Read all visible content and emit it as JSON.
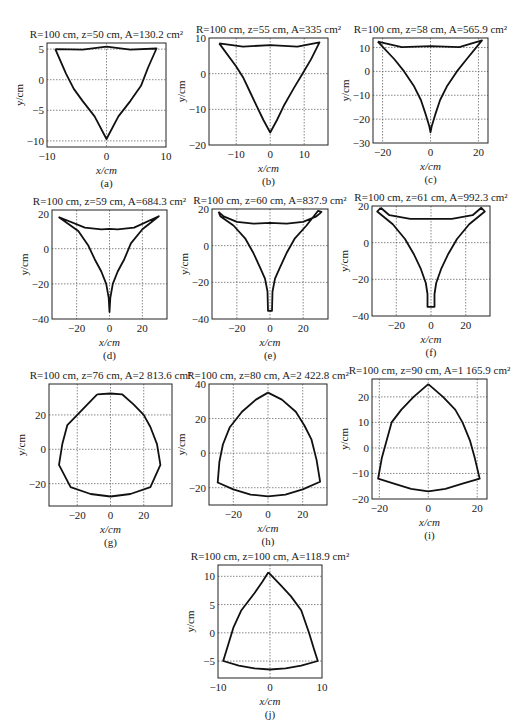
{
  "figure": {
    "caption_fragment": ""
  },
  "chart_data": [
    {
      "id": "a",
      "type": "line",
      "title": "R=100 cm, z=50 cm, A=130.2 cm²",
      "title_parts": {
        "R": "100 cm",
        "z": "50 cm",
        "A": "130.2 cm²"
      },
      "sublabel": "(a)",
      "xlabel": "x/cm",
      "ylabel": "y/cm",
      "xlim": [
        -10,
        10
      ],
      "ylim": [
        -11,
        6
      ],
      "xticks": [
        -10,
        0,
        10
      ],
      "yticks": [
        -10,
        -5,
        0,
        5
      ],
      "xgrid": [
        0
      ],
      "ygrid": [
        -10,
        -5,
        0,
        5
      ],
      "grid": true,
      "box": {
        "x": 47,
        "y": 43,
        "w": 119,
        "h": 104
      },
      "curves": [
        [
          [
            -8.6,
            5.0
          ],
          [
            -4,
            4.9
          ],
          [
            0,
            5.4
          ],
          [
            4,
            4.9
          ],
          [
            8.4,
            5.1
          ],
          [
            7,
            2
          ],
          [
            5.8,
            -1
          ],
          [
            4,
            -3.5
          ],
          [
            2,
            -6
          ],
          [
            0,
            -9.7
          ],
          [
            -2,
            -6
          ],
          [
            -4,
            -3.5
          ],
          [
            -5.5,
            -1.5
          ],
          [
            -6.8,
            1
          ],
          [
            -8.6,
            5.0
          ]
        ]
      ]
    },
    {
      "id": "b",
      "type": "line",
      "title": "R=100 cm, z=55 cm, A=335 cm²",
      "title_parts": {
        "R": "100 cm",
        "z": "55 cm",
        "A": "335 cm²"
      },
      "sublabel": "(b)",
      "xlabel": "x/cm",
      "ylabel": "y/cm",
      "xlim": [
        -18,
        17
      ],
      "ylim": [
        -20,
        10
      ],
      "xticks": [
        -10,
        0,
        10
      ],
      "yticks": [
        -20,
        -10,
        0,
        10
      ],
      "xgrid": [
        -10,
        0,
        10
      ],
      "ygrid": [
        -10,
        0
      ],
      "grid": true,
      "box": {
        "x": 209,
        "y": 38,
        "w": 119,
        "h": 107
      },
      "curves": [
        [
          [
            -15,
            8.5
          ],
          [
            -8,
            7.6
          ],
          [
            0,
            8.0
          ],
          [
            8,
            7.6
          ],
          [
            14.5,
            8.8
          ],
          [
            12,
            4
          ],
          [
            9.5,
            0
          ],
          [
            7,
            -4
          ],
          [
            4,
            -9
          ],
          [
            2,
            -13
          ],
          [
            0,
            -16.5
          ],
          [
            -2,
            -13
          ],
          [
            -4,
            -9
          ],
          [
            -6,
            -5
          ],
          [
            -8,
            -1
          ],
          [
            -10,
            2
          ],
          [
            -15,
            8.5
          ]
        ]
      ]
    },
    {
      "id": "c",
      "type": "line",
      "title": "R=100 cm, z=58 cm, A=565.9 cm²",
      "title_parts": {
        "R": "100 cm",
        "z": "58 cm",
        "A": "565.9 cm²"
      },
      "sublabel": "(c)",
      "xlabel": "x/cm",
      "ylabel": "y/cm",
      "xlim": [
        -24,
        24
      ],
      "ylim": [
        -30,
        14
      ],
      "xticks": [
        -20,
        0,
        20
      ],
      "yticks": [
        -30,
        -20,
        -10,
        0,
        10
      ],
      "xgrid": [
        -20,
        0,
        20
      ],
      "ygrid": [
        -20,
        -10,
        0,
        10
      ],
      "grid": true,
      "box": {
        "x": 373,
        "y": 38,
        "w": 115,
        "h": 105
      },
      "curves": [
        [
          [
            -22,
            12.5
          ],
          [
            -12,
            10.2
          ],
          [
            0,
            10.6
          ],
          [
            12,
            10.2
          ],
          [
            21.5,
            13
          ],
          [
            15,
            5
          ],
          [
            11,
            0
          ],
          [
            7,
            -6
          ],
          [
            4,
            -12
          ],
          [
            2,
            -18
          ],
          [
            0.5,
            -23
          ],
          [
            0,
            -25.5
          ],
          [
            -0.5,
            -23
          ],
          [
            -2,
            -18
          ],
          [
            -4,
            -12
          ],
          [
            -7,
            -6
          ],
          [
            -11,
            0
          ],
          [
            -15,
            5
          ],
          [
            -22,
            12.5
          ]
        ]
      ]
    },
    {
      "id": "d",
      "type": "line",
      "title": "R=100 cm, z=59 cm, A=684.3 cm²",
      "title_parts": {
        "R": "100 cm",
        "z": "59 cm",
        "A": "684.3 cm²"
      },
      "sublabel": "(d)",
      "xlabel": "x/cm",
      "ylabel": "y/cm",
      "xlim": [
        -35,
        35
      ],
      "ylim": [
        -40,
        22
      ],
      "xticks": [
        -20,
        0,
        20
      ],
      "yticks": [
        -40,
        -20,
        0,
        20
      ],
      "xgrid": [
        -20,
        0,
        20
      ],
      "ygrid": [
        -20,
        0
      ],
      "grid": true,
      "box": {
        "x": 52,
        "y": 210,
        "w": 115,
        "h": 109
      },
      "curves": [
        [
          [
            -31,
            18
          ],
          [
            -15,
            12
          ],
          [
            -5,
            11
          ],
          [
            0,
            11.3
          ],
          [
            5,
            11
          ],
          [
            15,
            12
          ],
          [
            30,
            18.5
          ],
          [
            20,
            11
          ],
          [
            13,
            3
          ],
          [
            9,
            -6
          ],
          [
            5,
            -13
          ],
          [
            2,
            -20
          ],
          [
            0.5,
            -28
          ],
          [
            0,
            -36
          ],
          [
            -0.5,
            -28
          ],
          [
            -2,
            -20
          ],
          [
            -5,
            -13
          ],
          [
            -9,
            -6
          ],
          [
            -13,
            2
          ],
          [
            -19,
            10
          ],
          [
            -31,
            18
          ]
        ]
      ]
    },
    {
      "id": "e",
      "type": "line",
      "title": "R=100 cm, z=60 cm, A=837.9 cm²",
      "title_parts": {
        "R": "100 cm",
        "z": "60 cm",
        "A": "837.9 cm²"
      },
      "sublabel": "(e)",
      "xlabel": "x/cm",
      "ylabel": "y/cm",
      "xlim": [
        -35,
        35
      ],
      "ylim": [
        -40,
        20
      ],
      "xticks": [
        -20,
        0,
        20
      ],
      "yticks": [
        -40,
        -20,
        0,
        20
      ],
      "xgrid": [
        -20,
        0,
        20
      ],
      "ygrid": [
        -20,
        0
      ],
      "grid": true,
      "box": {
        "x": 212,
        "y": 209,
        "w": 116,
        "h": 110
      },
      "curves": [
        [
          [
            -31,
            18.5
          ],
          [
            -28,
            16
          ],
          [
            -20,
            13
          ],
          [
            -10,
            12
          ],
          [
            0,
            12.5
          ],
          [
            10,
            12
          ],
          [
            20,
            13
          ],
          [
            28,
            16
          ],
          [
            30,
            17.5
          ],
          [
            31,
            18.5
          ],
          [
            29,
            19
          ],
          [
            22,
            11
          ],
          [
            15,
            4
          ],
          [
            10,
            -4
          ],
          [
            6,
            -12
          ],
          [
            3,
            -18
          ],
          [
            1.5,
            -25
          ],
          [
            1.2,
            -35.5
          ],
          [
            -1.2,
            -35.5
          ],
          [
            -1.5,
            -25
          ],
          [
            -3,
            -18
          ],
          [
            -6,
            -12
          ],
          [
            -10,
            -4
          ],
          [
            -15,
            4
          ],
          [
            -22,
            11
          ],
          [
            -30,
            16
          ],
          [
            -31,
            18.5
          ]
        ]
      ]
    },
    {
      "id": "f",
      "type": "line",
      "title": "R=100 cm, z=61 cm, A=992.3 cm²",
      "title_parts": {
        "R": "100 cm",
        "z": "61 cm",
        "A": "992.3 cm²"
      },
      "sublabel": "(f)",
      "xlabel": "x/cm",
      "ylabel": "y/cm",
      "xlim": [
        -34,
        34
      ],
      "ylim": [
        -40,
        20
      ],
      "xticks": [
        -20,
        0,
        20
      ],
      "yticks": [
        -40,
        -20,
        0,
        20
      ],
      "xgrid": [
        -20,
        0,
        20
      ],
      "ygrid": [
        -20,
        0
      ],
      "grid": true,
      "box": {
        "x": 372,
        "y": 206,
        "w": 118,
        "h": 110
      },
      "curves": [
        [
          [
            -29,
            19
          ],
          [
            -24,
            15
          ],
          [
            -12,
            13
          ],
          [
            0,
            13
          ],
          [
            12,
            13
          ],
          [
            24,
            15
          ],
          [
            29,
            19
          ],
          [
            31,
            17
          ],
          [
            22,
            10
          ],
          [
            15,
            2
          ],
          [
            10,
            -6
          ],
          [
            6,
            -14
          ],
          [
            3,
            -22
          ],
          [
            2,
            -28
          ],
          [
            2,
            -35
          ],
          [
            -2,
            -35
          ],
          [
            -2,
            -28
          ],
          [
            -3,
            -22
          ],
          [
            -6,
            -14
          ],
          [
            -10,
            -6
          ],
          [
            -15,
            2
          ],
          [
            -22,
            10
          ],
          [
            -31,
            17
          ],
          [
            -29,
            19
          ]
        ]
      ]
    },
    {
      "id": "g",
      "type": "line",
      "title": "R=100 cm, z=76 cm, A=2 813.6 cm²",
      "title_parts": {
        "R": "100 cm",
        "z": "76 cm",
        "A": "2 813.6 cm²"
      },
      "sublabel": "(g)",
      "xlabel": "x/cm",
      "ylabel": "y/cm",
      "xlim": [
        -37,
        37
      ],
      "ylim": [
        -33,
        38
      ],
      "xticks": [
        -20,
        0,
        20
      ],
      "yticks": [
        -20,
        0,
        20
      ],
      "xgrid": [
        -20,
        0,
        20
      ],
      "ygrid": [
        -20,
        0,
        20
      ],
      "grid": true,
      "box": {
        "x": 49,
        "y": 384,
        "w": 123,
        "h": 122
      },
      "curves": [
        [
          [
            -8,
            32
          ],
          [
            0,
            32.5
          ],
          [
            7,
            32
          ],
          [
            14,
            26
          ],
          [
            20,
            20
          ],
          [
            24,
            13
          ],
          [
            28,
            3
          ],
          [
            30,
            -9
          ],
          [
            24,
            -22
          ],
          [
            12,
            -26
          ],
          [
            0,
            -27.5
          ],
          [
            -12,
            -26
          ],
          [
            -24,
            -22
          ],
          [
            -31,
            -9
          ],
          [
            -29,
            3
          ],
          [
            -26,
            14
          ],
          [
            -20,
            20
          ],
          [
            -14,
            26
          ],
          [
            -8,
            32
          ]
        ]
      ]
    },
    {
      "id": "h",
      "type": "line",
      "title": "R=100 cm, z=80 cm, A=2 422.8 cm²",
      "title_parts": {
        "R": "100 cm",
        "z": "80 cm",
        "A": "2 422.8 cm²"
      },
      "sublabel": "(h)",
      "xlabel": "x/cm",
      "ylabel": "y/cm",
      "xlim": [
        -34,
        34
      ],
      "ylim": [
        -30,
        40
      ],
      "xticks": [
        -20,
        0,
        20
      ],
      "yticks": [
        -20,
        0,
        20,
        40
      ],
      "xgrid": [
        -20,
        0,
        20
      ],
      "ygrid": [
        -20,
        0,
        20
      ],
      "grid": true,
      "box": {
        "x": 209,
        "y": 384,
        "w": 118,
        "h": 121
      },
      "curves": [
        [
          [
            0,
            35
          ],
          [
            8,
            31
          ],
          [
            16,
            24
          ],
          [
            21,
            16
          ],
          [
            25,
            8
          ],
          [
            28,
            -4
          ],
          [
            30,
            -16.5
          ],
          [
            20,
            -21
          ],
          [
            10,
            -24
          ],
          [
            0,
            -25
          ],
          [
            -10,
            -24
          ],
          [
            -20,
            -21
          ],
          [
            -29,
            -17
          ],
          [
            -28,
            -5
          ],
          [
            -26,
            5
          ],
          [
            -22,
            15
          ],
          [
            -15,
            24
          ],
          [
            -7,
            31
          ],
          [
            0,
            35
          ]
        ]
      ]
    },
    {
      "id": "i",
      "type": "line",
      "title": "R=100 cm, z=90 cm, A=1 165.9 cm²",
      "title_parts": {
        "R": "100 cm, z=90 cm",
        "z": "90 cm",
        "A": "1 165.9 cm²"
      },
      "sublabel": "(i)",
      "xlabel": "x/cm",
      "ylabel": "y/cm",
      "xlim": [
        -23,
        24
      ],
      "ylim": [
        -20,
        27
      ],
      "xticks": [
        -20,
        0,
        20
      ],
      "yticks": [
        -20,
        -10,
        0,
        10,
        20
      ],
      "xgrid": [
        -20,
        0,
        20
      ],
      "ygrid": [
        -10,
        0,
        10,
        20
      ],
      "grid": true,
      "box": {
        "x": 372,
        "y": 379,
        "w": 115,
        "h": 120
      },
      "curves": [
        [
          [
            0,
            25
          ],
          [
            6,
            20
          ],
          [
            11,
            15
          ],
          [
            14,
            10
          ],
          [
            17,
            3
          ],
          [
            19,
            -4
          ],
          [
            21,
            -12
          ],
          [
            14,
            -14
          ],
          [
            7,
            -16
          ],
          [
            0,
            -17
          ],
          [
            -7,
            -16
          ],
          [
            -14,
            -14
          ],
          [
            -20.5,
            -12
          ],
          [
            -19,
            -4
          ],
          [
            -17,
            3
          ],
          [
            -15,
            10
          ],
          [
            -11,
            15
          ],
          [
            -6,
            20
          ],
          [
            0,
            25
          ]
        ]
      ]
    },
    {
      "id": "j",
      "type": "line",
      "title": "R=100 cm, z=100 cm, A=118.9 cm²",
      "title_parts": {
        "R": "100 cm",
        "z": "100 cm",
        "A": "118.9 cm²"
      },
      "sublabel": "(j)",
      "xlabel": "x/cm",
      "ylabel": "y/cm",
      "xlim": [
        -10,
        10
      ],
      "ylim": [
        -8,
        12
      ],
      "xticks": [
        -10,
        0,
        10
      ],
      "yticks": [
        -5,
        0,
        5,
        10
      ],
      "xgrid": [
        0
      ],
      "ygrid": [
        -5,
        0,
        5,
        10
      ],
      "grid": true,
      "box": {
        "x": 218,
        "y": 565,
        "w": 104,
        "h": 113
      },
      "curves": [
        [
          [
            -0.3,
            10.7
          ],
          [
            2,
            8.5
          ],
          [
            4,
            6.5
          ],
          [
            6,
            4
          ],
          [
            7.5,
            0
          ],
          [
            8.5,
            -3
          ],
          [
            9.2,
            -5
          ],
          [
            6,
            -5.8
          ],
          [
            3,
            -6.3
          ],
          [
            0,
            -6.5
          ],
          [
            -3,
            -6.3
          ],
          [
            -6,
            -5.8
          ],
          [
            -9,
            -5
          ],
          [
            -8,
            -2
          ],
          [
            -7,
            1
          ],
          [
            -5.5,
            4
          ],
          [
            -3,
            7
          ],
          [
            -1.5,
            9
          ],
          [
            -0.3,
            10.7
          ]
        ]
      ]
    }
  ]
}
